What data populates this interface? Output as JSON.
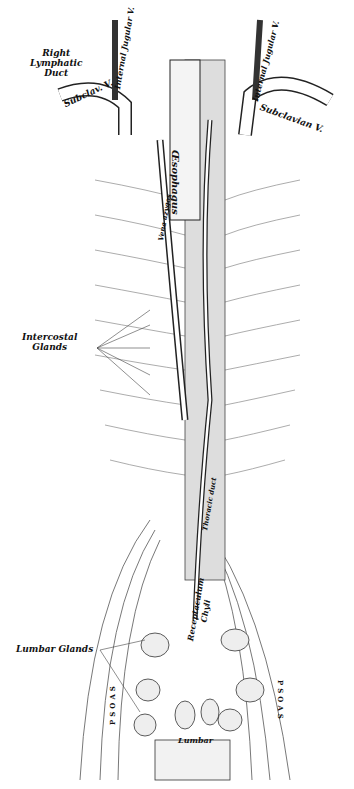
{
  "figure": {
    "labels": {
      "right_lymphatic_duct": [
        "Right",
        "Lymphatic",
        "Duct"
      ],
      "internal_jugular_left": "Internal Jugular V.",
      "subclav_left": "Subclav. V.",
      "esophagus": "Œsophagus",
      "internal_jugular_right": "Internal Jugular V.",
      "subclavian_right": "Subclavian V.",
      "vena_azygos": "Vena azygos",
      "intercostal_glands": [
        "Intercostal",
        "Glands"
      ],
      "thoracic_duct": "Thoracic duct",
      "receptaculum_chyli": [
        "Receptaculum",
        "Chyli"
      ],
      "lumbar_glands": "Lumbar Glands",
      "psoas_left": "PSOAS",
      "psoas_right": "PSOAS",
      "lumbar": "Lumbar"
    },
    "colors": {
      "ink": "#111111",
      "shade": "#777777",
      "paper": "#ffffff"
    }
  }
}
